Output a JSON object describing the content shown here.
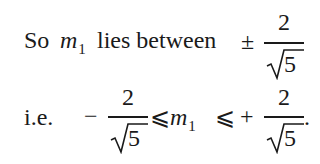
{
  "line1": {
    "prefix": "So",
    "variable": "m",
    "subscript": "1",
    "text": "lies between",
    "sign": "±",
    "fraction": {
      "numerator": "2",
      "denominator_radical": "√",
      "denominator_radicand": "5"
    }
  },
  "line2": {
    "prefix": "i.e.",
    "left_sign": "−",
    "left_fraction": {
      "numerator": "2",
      "denominator_radical": "√",
      "denominator_radicand": "5"
    },
    "relation1": "⩽",
    "variable": "m",
    "subscript": "1",
    "relation2": "⩽",
    "right_sign": "+",
    "right_fraction": {
      "numerator": "2",
      "denominator_radical": "√",
      "denominator_radicand": "5"
    },
    "terminator": "."
  }
}
